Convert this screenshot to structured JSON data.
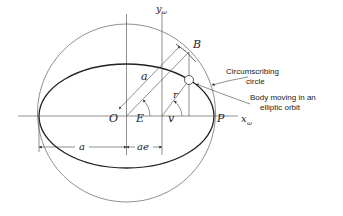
{
  "figure": {
    "labels": {
      "y_axis": "y",
      "y_axis_sub": "ω",
      "x_axis": "x",
      "x_axis_sub": "ω",
      "point_B": "B",
      "center_O": "O",
      "periapsis_P": "P",
      "eccentric_anomaly": "E",
      "true_anomaly": "v",
      "radius_r": "r",
      "semi_major_a_upper": "a",
      "semi_major_a_lower": "a",
      "focal_offset": "ae"
    },
    "annotations": {
      "circle_line1": "Circumscribing",
      "circle_line2": "circle",
      "body_line1": "Body moving in an",
      "body_line2": "elliptic orbit"
    },
    "geometry": {
      "center": [
        126.5,
        116
      ],
      "semi_major": 87.5,
      "semi_minor": 52,
      "circle_radius": 89,
      "focus_x": 162,
      "body_x": 189,
      "colors": {
        "stroke": "#222222",
        "background": "#ffffff"
      }
    }
  }
}
